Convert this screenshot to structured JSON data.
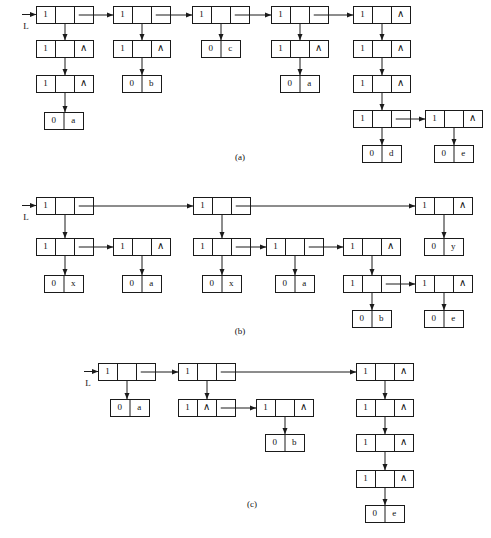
{
  "figure": {
    "head_pointer_label": "L",
    "nil_symbol": "∧",
    "tag_branch": "1",
    "tag_atom": "0",
    "captions": [
      {
        "id": "caption-a",
        "text": "(a)",
        "x": 240,
        "y": 158
      },
      {
        "id": "caption-b",
        "text": "(b)",
        "x": 240,
        "y": 332
      },
      {
        "id": "caption-c",
        "text": "(c)",
        "x": 252,
        "y": 505
      }
    ],
    "heads": [
      {
        "id": "head-a",
        "label": "L",
        "label_x": 26,
        "label_y": 27,
        "arrow_x1": 22,
        "arrow_y1": 14,
        "arrow_x2": 36,
        "arrow_y2": 14
      },
      {
        "id": "head-b",
        "label": "L",
        "label_x": 26,
        "label_y": 218,
        "arrow_x1": 22,
        "arrow_y1": 205,
        "arrow_x2": 36,
        "arrow_y2": 205
      },
      {
        "id": "head-c",
        "label": "L",
        "label_x": 88,
        "label_y": 384,
        "arrow_x1": 84,
        "arrow_y1": 371,
        "arrow_x2": 98,
        "arrow_y2": 371
      }
    ],
    "sections": [
      {
        "id": "section-a",
        "caption": "(a)",
        "nodes": [
          {
            "id": "a-n1",
            "kind": "branch",
            "x": 36,
            "y": 6,
            "w": 57,
            "h": 17,
            "tag": "1",
            "right": "link"
          },
          {
            "id": "a-n2",
            "kind": "branch",
            "x": 36,
            "y": 40,
            "w": 57,
            "h": 17,
            "tag": "1",
            "right": "nil"
          },
          {
            "id": "a-n3",
            "kind": "branch",
            "x": 36,
            "y": 75,
            "w": 57,
            "h": 17,
            "tag": "1",
            "right": "nil"
          },
          {
            "id": "a-l1",
            "kind": "atom",
            "x": 44,
            "y": 112,
            "w": 39,
            "h": 17,
            "tag": "0",
            "value": "a"
          },
          {
            "id": "a-n4",
            "kind": "branch",
            "x": 113,
            "y": 6,
            "w": 57,
            "h": 17,
            "tag": "1",
            "right": "link"
          },
          {
            "id": "a-n5",
            "kind": "branch",
            "x": 113,
            "y": 40,
            "w": 57,
            "h": 17,
            "tag": "1",
            "right": "nil"
          },
          {
            "id": "a-l2",
            "kind": "atom",
            "x": 122,
            "y": 75,
            "w": 39,
            "h": 17,
            "tag": "0",
            "value": "b"
          },
          {
            "id": "a-n6",
            "kind": "branch",
            "x": 192,
            "y": 6,
            "w": 57,
            "h": 17,
            "tag": "1",
            "right": "link"
          },
          {
            "id": "a-l3",
            "kind": "atom",
            "x": 201,
            "y": 40,
            "w": 39,
            "h": 17,
            "tag": "0",
            "value": "c"
          },
          {
            "id": "a-n7",
            "kind": "branch",
            "x": 271,
            "y": 6,
            "w": 57,
            "h": 17,
            "tag": "1",
            "right": "link"
          },
          {
            "id": "a-n8",
            "kind": "branch",
            "x": 271,
            "y": 40,
            "w": 57,
            "h": 17,
            "tag": "1",
            "right": "nil"
          },
          {
            "id": "a-l4",
            "kind": "atom",
            "x": 280,
            "y": 75,
            "w": 39,
            "h": 17,
            "tag": "0",
            "value": "a"
          },
          {
            "id": "a-n9",
            "kind": "branch",
            "x": 353,
            "y": 6,
            "w": 57,
            "h": 17,
            "tag": "1",
            "right": "nil"
          },
          {
            "id": "a-n10",
            "kind": "branch",
            "x": 353,
            "y": 40,
            "w": 57,
            "h": 17,
            "tag": "1",
            "right": "nil"
          },
          {
            "id": "a-n11",
            "kind": "branch",
            "x": 353,
            "y": 75,
            "w": 57,
            "h": 17,
            "tag": "1",
            "right": "nil"
          },
          {
            "id": "a-n12",
            "kind": "branch",
            "x": 353,
            "y": 110,
            "w": 57,
            "h": 17,
            "tag": "1",
            "right": "link"
          },
          {
            "id": "a-l5",
            "kind": "atom",
            "x": 362,
            "y": 145,
            "w": 39,
            "h": 17,
            "tag": "0",
            "value": "d"
          },
          {
            "id": "a-n13",
            "kind": "branch",
            "x": 425,
            "y": 110,
            "w": 57,
            "h": 17,
            "tag": "1",
            "right": "nil"
          },
          {
            "id": "a-l6",
            "kind": "atom",
            "x": 434,
            "y": 145,
            "w": 39,
            "h": 17,
            "tag": "0",
            "value": "e"
          }
        ],
        "links": [
          {
            "id": "a-e1",
            "type": "h",
            "from": "a-n1",
            "to": "a-n4"
          },
          {
            "id": "a-e2",
            "type": "h",
            "from": "a-n4",
            "to": "a-n6"
          },
          {
            "id": "a-e3",
            "type": "h",
            "from": "a-n6",
            "to": "a-n7"
          },
          {
            "id": "a-e4",
            "type": "h",
            "from": "a-n7",
            "to": "a-n9"
          },
          {
            "id": "a-e5",
            "type": "h",
            "from": "a-n12",
            "to": "a-n13"
          },
          {
            "id": "a-e6",
            "type": "v",
            "from": "a-n1",
            "to": "a-n2"
          },
          {
            "id": "a-e7",
            "type": "v",
            "from": "a-n2",
            "to": "a-n3"
          },
          {
            "id": "a-e8",
            "type": "v",
            "from": "a-n3",
            "to": "a-l1"
          },
          {
            "id": "a-e9",
            "type": "v",
            "from": "a-n4",
            "to": "a-n5"
          },
          {
            "id": "a-e10",
            "type": "v",
            "from": "a-n5",
            "to": "a-l2"
          },
          {
            "id": "a-e11",
            "type": "v",
            "from": "a-n6",
            "to": "a-l3"
          },
          {
            "id": "a-e12",
            "type": "v",
            "from": "a-n7",
            "to": "a-n8"
          },
          {
            "id": "a-e13",
            "type": "v",
            "from": "a-n8",
            "to": "a-l4"
          },
          {
            "id": "a-e14",
            "type": "v",
            "from": "a-n9",
            "to": "a-n10"
          },
          {
            "id": "a-e15",
            "type": "v",
            "from": "a-n10",
            "to": "a-n11"
          },
          {
            "id": "a-e16",
            "type": "v",
            "from": "a-n11",
            "to": "a-n12"
          },
          {
            "id": "a-e17",
            "type": "v",
            "from": "a-n12",
            "to": "a-l5"
          },
          {
            "id": "a-e18",
            "type": "v",
            "from": "a-n13",
            "to": "a-l6"
          }
        ]
      },
      {
        "id": "section-b",
        "caption": "(b)",
        "nodes": [
          {
            "id": "b-n1",
            "kind": "branch",
            "x": 36,
            "y": 197,
            "w": 57,
            "h": 17,
            "tag": "1",
            "right": "link"
          },
          {
            "id": "b-n2",
            "kind": "branch",
            "x": 36,
            "y": 238,
            "w": 57,
            "h": 17,
            "tag": "1",
            "right": "link"
          },
          {
            "id": "b-l1",
            "kind": "atom",
            "x": 44,
            "y": 275,
            "w": 39,
            "h": 17,
            "tag": "0",
            "value": "x"
          },
          {
            "id": "b-n3",
            "kind": "branch",
            "x": 113,
            "y": 238,
            "w": 57,
            "h": 17,
            "tag": "1",
            "right": "nil"
          },
          {
            "id": "b-l2",
            "kind": "atom",
            "x": 122,
            "y": 275,
            "w": 39,
            "h": 17,
            "tag": "0",
            "value": "a"
          },
          {
            "id": "b-n4",
            "kind": "branch",
            "x": 193,
            "y": 197,
            "w": 57,
            "h": 17,
            "tag": "1",
            "right": "link"
          },
          {
            "id": "b-n5",
            "kind": "branch",
            "x": 193,
            "y": 238,
            "w": 57,
            "h": 17,
            "tag": "1",
            "right": "link"
          },
          {
            "id": "b-l3",
            "kind": "atom",
            "x": 202,
            "y": 275,
            "w": 39,
            "h": 17,
            "tag": "0",
            "value": "x"
          },
          {
            "id": "b-n6",
            "kind": "branch",
            "x": 266,
            "y": 238,
            "w": 57,
            "h": 17,
            "tag": "1",
            "right": "link"
          },
          {
            "id": "b-l4",
            "kind": "atom",
            "x": 275,
            "y": 275,
            "w": 39,
            "h": 17,
            "tag": "0",
            "value": "a"
          },
          {
            "id": "b-n7",
            "kind": "branch",
            "x": 343,
            "y": 238,
            "w": 57,
            "h": 17,
            "tag": "1",
            "right": "nil"
          },
          {
            "id": "b-n8",
            "kind": "branch",
            "x": 343,
            "y": 275,
            "w": 57,
            "h": 17,
            "tag": "1",
            "right": "link"
          },
          {
            "id": "b-l5",
            "kind": "atom",
            "x": 352,
            "y": 310,
            "w": 39,
            "h": 17,
            "tag": "0",
            "value": "b"
          },
          {
            "id": "b-n9",
            "kind": "branch",
            "x": 415,
            "y": 275,
            "w": 57,
            "h": 17,
            "tag": "1",
            "right": "nil"
          },
          {
            "id": "b-l6",
            "kind": "atom",
            "x": 424,
            "y": 310,
            "w": 39,
            "h": 17,
            "tag": "0",
            "value": "e"
          },
          {
            "id": "b-n10",
            "kind": "branch",
            "x": 415,
            "y": 197,
            "w": 57,
            "h": 17,
            "tag": "1",
            "right": "nil"
          },
          {
            "id": "b-l7",
            "kind": "atom",
            "x": 424,
            "y": 238,
            "w": 39,
            "h": 17,
            "tag": "0",
            "value": "y"
          }
        ],
        "links": [
          {
            "id": "b-e1",
            "type": "h",
            "from": "b-n1",
            "to": "b-n4"
          },
          {
            "id": "b-e2",
            "type": "h",
            "from": "b-n4",
            "to": "b-n10"
          },
          {
            "id": "b-e3",
            "type": "h",
            "from": "b-n2",
            "to": "b-n3"
          },
          {
            "id": "b-e4",
            "type": "h",
            "from": "b-n5",
            "to": "b-n6"
          },
          {
            "id": "b-e5",
            "type": "h",
            "from": "b-n6",
            "to": "b-n7"
          },
          {
            "id": "b-e6",
            "type": "h",
            "from": "b-n8",
            "to": "b-n9"
          },
          {
            "id": "b-e7",
            "type": "v",
            "from": "b-n1",
            "to": "b-n2"
          },
          {
            "id": "b-e8",
            "type": "v",
            "from": "b-n2",
            "to": "b-l1"
          },
          {
            "id": "b-e9",
            "type": "v",
            "from": "b-n3",
            "to": "b-l2"
          },
          {
            "id": "b-e10",
            "type": "v",
            "from": "b-n4",
            "to": "b-n5"
          },
          {
            "id": "b-e11",
            "type": "v",
            "from": "b-n5",
            "to": "b-l3"
          },
          {
            "id": "b-e12",
            "type": "v",
            "from": "b-n6",
            "to": "b-l4"
          },
          {
            "id": "b-e13",
            "type": "v",
            "from": "b-n7",
            "to": "b-n8"
          },
          {
            "id": "b-e14",
            "type": "v",
            "from": "b-n8",
            "to": "b-l5"
          },
          {
            "id": "b-e15",
            "type": "v",
            "from": "b-n9",
            "to": "b-l6"
          },
          {
            "id": "b-e16",
            "type": "v",
            "from": "b-n10",
            "to": "b-l7"
          }
        ]
      },
      {
        "id": "section-c",
        "caption": "(c)",
        "nodes": [
          {
            "id": "c-n1",
            "kind": "branch",
            "x": 98,
            "y": 363,
            "w": 57,
            "h": 17,
            "tag": "1",
            "right": "link"
          },
          {
            "id": "c-l1",
            "kind": "atom",
            "x": 110,
            "y": 399,
            "w": 39,
            "h": 17,
            "tag": "0",
            "value": "a"
          },
          {
            "id": "c-n2",
            "kind": "branch",
            "x": 178,
            "y": 363,
            "w": 57,
            "h": 17,
            "tag": "1",
            "right": "link"
          },
          {
            "id": "c-n3",
            "kind": "branch",
            "x": 178,
            "y": 399,
            "w": 57,
            "h": 17,
            "tag": "1",
            "right": "link",
            "mid": "nil"
          },
          {
            "id": "c-n4",
            "kind": "branch",
            "x": 256,
            "y": 399,
            "w": 57,
            "h": 17,
            "tag": "1",
            "right": "nil"
          },
          {
            "id": "c-l2",
            "kind": "atom",
            "x": 265,
            "y": 434,
            "w": 39,
            "h": 17,
            "tag": "0",
            "value": "b"
          },
          {
            "id": "c-n5",
            "kind": "branch",
            "x": 356,
            "y": 363,
            "w": 57,
            "h": 17,
            "tag": "1",
            "right": "nil"
          },
          {
            "id": "c-n6",
            "kind": "branch",
            "x": 356,
            "y": 399,
            "w": 57,
            "h": 17,
            "tag": "1",
            "right": "nil"
          },
          {
            "id": "c-n7",
            "kind": "branch",
            "x": 356,
            "y": 434,
            "w": 57,
            "h": 17,
            "tag": "1",
            "right": "nil"
          },
          {
            "id": "c-n8",
            "kind": "branch",
            "x": 356,
            "y": 470,
            "w": 57,
            "h": 17,
            "tag": "1",
            "right": "nil"
          },
          {
            "id": "c-l3",
            "kind": "atom",
            "x": 365,
            "y": 505,
            "w": 39,
            "h": 17,
            "tag": "0",
            "value": "e"
          }
        ],
        "links": [
          {
            "id": "c-e1",
            "type": "h",
            "from": "c-n1",
            "to": "c-n2"
          },
          {
            "id": "c-e2",
            "type": "h",
            "from": "c-n2",
            "to": "c-n5"
          },
          {
            "id": "c-e3",
            "type": "h",
            "from": "c-n3",
            "to": "c-n4"
          },
          {
            "id": "c-e4",
            "type": "v",
            "from": "c-n1",
            "to": "c-l1"
          },
          {
            "id": "c-e5",
            "type": "v",
            "from": "c-n2",
            "to": "c-n3"
          },
          {
            "id": "c-e6",
            "type": "v",
            "from": "c-n4",
            "to": "c-l2"
          },
          {
            "id": "c-e7",
            "type": "v",
            "from": "c-n5",
            "to": "c-n6"
          },
          {
            "id": "c-e8",
            "type": "v",
            "from": "c-n6",
            "to": "c-n7"
          },
          {
            "id": "c-e9",
            "type": "v",
            "from": "c-n7",
            "to": "c-n8"
          },
          {
            "id": "c-e10",
            "type": "v",
            "from": "c-n8",
            "to": "c-l3"
          }
        ]
      }
    ]
  }
}
